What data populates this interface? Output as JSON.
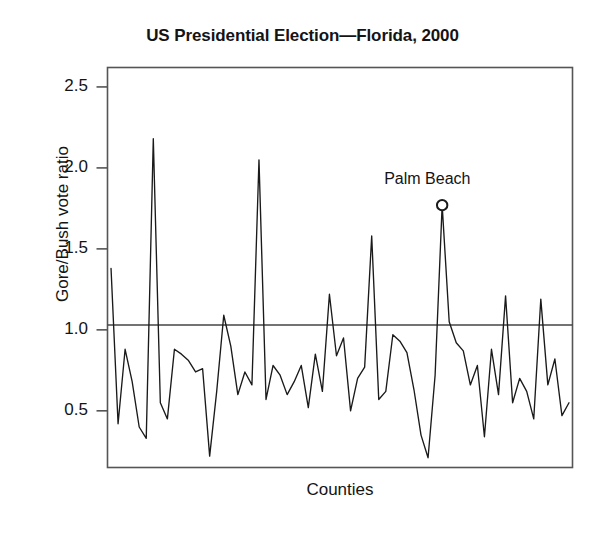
{
  "chart_data": {
    "type": "line",
    "title": "US Presidential Election—Florida, 2000",
    "xlabel": "Counties",
    "ylabel": "Gore/Bush vote ratio",
    "ylim": [
      0.15,
      2.62
    ],
    "yticks": [
      0.5,
      1.0,
      1.5,
      2.0,
      2.5
    ],
    "ytick_labels": [
      "0.5",
      "1.0",
      "1.5",
      "2.0",
      "2.5"
    ],
    "xlim": [
      0,
      66
    ],
    "xticks": [],
    "xtick_labels": [],
    "grid": false,
    "legend": false,
    "frame": true,
    "reference_line": {
      "orientation": "horizontal",
      "value": 1.03,
      "label": ""
    },
    "annotations": [
      {
        "text": "Palm Beach",
        "x_index": 47,
        "value": 1.77,
        "marker": "open-circle"
      }
    ],
    "series": [
      {
        "name": "Gore/Bush vote ratio by county",
        "values": [
          1.38,
          0.42,
          0.88,
          0.68,
          0.4,
          0.33,
          2.18,
          0.55,
          0.45,
          0.88,
          0.85,
          0.81,
          0.74,
          0.76,
          0.22,
          0.62,
          1.09,
          0.9,
          0.6,
          0.74,
          0.66,
          2.05,
          0.57,
          0.78,
          0.72,
          0.6,
          0.68,
          0.78,
          0.52,
          0.85,
          0.62,
          1.22,
          0.84,
          0.95,
          0.5,
          0.7,
          0.77,
          1.58,
          0.57,
          0.62,
          0.97,
          0.93,
          0.86,
          0.63,
          0.35,
          0.21,
          0.72,
          1.77,
          1.05,
          0.92,
          0.87,
          0.66,
          0.78,
          0.34,
          0.88,
          0.6,
          1.21,
          0.55,
          0.7,
          0.62,
          0.45,
          1.19,
          0.66,
          0.82,
          0.47,
          0.55
        ]
      }
    ]
  },
  "style": {
    "line_color": "#1a1a1a",
    "frame_color": "#555555",
    "ref_line_color": "#444444",
    "text_color": "#141414",
    "background": "#ffffff"
  }
}
